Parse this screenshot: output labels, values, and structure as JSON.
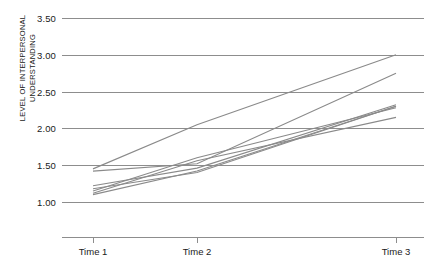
{
  "chart_data": {
    "type": "line",
    "title": "",
    "xlabel": "",
    "ylabel": "LEVEL OF INTERPERSONAL\nUNDERSTANDING",
    "x": [
      "Time 1",
      "Time 2",
      "Time 3"
    ],
    "categories": [
      "Time 1",
      "Time 2",
      "Time 3"
    ],
    "yticks": [
      "1.00",
      "1.50",
      "2.00",
      "2.50",
      "3.00",
      "3.50"
    ],
    "ytick_values": [
      1.0,
      1.5,
      2.0,
      2.5,
      3.0,
      3.5
    ],
    "ylim": [
      0.78,
      3.5
    ],
    "grid": true,
    "legend": "none",
    "line_color": "#8a8a8a",
    "axis_color": "#8d8d8d",
    "text_color": "#1a1a1a",
    "background": "#ffffff",
    "series": [
      {
        "name": "Participant 1",
        "values": [
          1.45,
          2.05,
          3.0
        ]
      },
      {
        "name": "Participant 2",
        "values": [
          1.42,
          1.52,
          2.75
        ]
      },
      {
        "name": "Participant 3",
        "values": [
          1.22,
          1.46,
          2.32
        ]
      },
      {
        "name": "Participant 4",
        "values": [
          1.18,
          1.4,
          2.3
        ]
      },
      {
        "name": "Participant 5",
        "values": [
          1.15,
          1.6,
          2.28
        ]
      },
      {
        "name": "Participant 6",
        "values": [
          1.12,
          1.56,
          2.15
        ]
      },
      {
        "name": "Participant 7",
        "values": [
          1.1,
          1.42,
          2.3
        ]
      }
    ]
  }
}
